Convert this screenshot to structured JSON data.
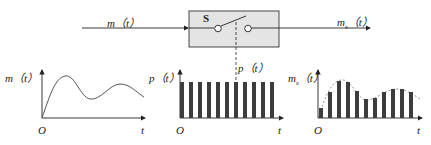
{
  "diagram": {
    "input_label": "m（t）",
    "output_label_main": "m",
    "output_label_sub": "s",
    "output_label_tail": "（t）",
    "switch_label": "S",
    "pulse_label": "p（t）",
    "box_fill": "#e4e4e4",
    "bar_color": "#3c3c3c"
  },
  "graphs": [
    {
      "y_label": "m（t）",
      "origin_label": "O",
      "x_label": "t"
    },
    {
      "y_label": "p（t）",
      "origin_label": "O",
      "x_label": "t"
    },
    {
      "y_label_main": "m",
      "y_label_sub": "s",
      "y_label_tail": "（t）",
      "origin_label": "O",
      "x_label": "t"
    }
  ]
}
